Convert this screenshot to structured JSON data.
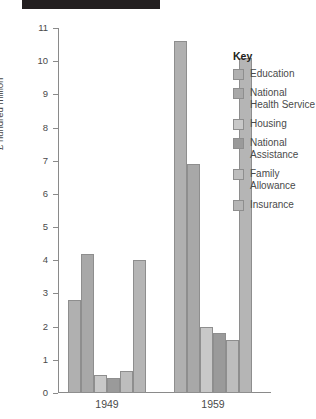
{
  "topbar": {
    "name": "black-title-bar"
  },
  "chart_data": {
    "type": "bar",
    "title": "",
    "xlabel": "",
    "ylabel": "£ hundred million",
    "ylim": [
      0,
      11
    ],
    "yticks": [
      0,
      1,
      2,
      3,
      4,
      5,
      6,
      7,
      8,
      9,
      10,
      11
    ],
    "grid": false,
    "legend_position": "right",
    "legend_title": "Key",
    "categories": [
      "1949",
      "1959"
    ],
    "series": [
      {
        "name": "Education",
        "color": "#b0b0b0",
        "values": [
          2.8,
          10.6
        ]
      },
      {
        "name": "National Health Service",
        "color": "#a8a8a8",
        "values": [
          4.2,
          6.9
        ]
      },
      {
        "name": "Housing",
        "color": "#c8c8c8",
        "values": [
          0.55,
          2.0
        ]
      },
      {
        "name": "National Assistance",
        "color": "#9a9a9a",
        "values": [
          0.45,
          1.8
        ]
      },
      {
        "name": "Family Allowance",
        "color": "#bdbdbd",
        "values": [
          0.65,
          1.6
        ]
      },
      {
        "name": "Insurance",
        "color": "#b5b5b5",
        "values": [
          4.0,
          10.1
        ]
      }
    ]
  }
}
